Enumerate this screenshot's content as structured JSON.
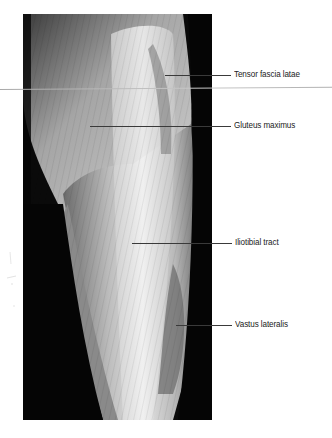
{
  "figure": {
    "type": "anatomical dissection photograph",
    "view": "lateral thigh",
    "labels": [
      {
        "id": "tensor-fascia-latae",
        "text": "Tensor fascia latae"
      },
      {
        "id": "gluteus-maximus",
        "text": "Gluteus maximus"
      },
      {
        "id": "iliotibial-tract",
        "text": "Iliotibial tract"
      },
      {
        "id": "vastus-lateralis",
        "text": "Vastus lateralis"
      }
    ]
  },
  "colors": {
    "background": "#ffffff",
    "photo_background": "#0a0a0a",
    "label_text": "#222222",
    "leader_line": "#3a3a3a"
  }
}
